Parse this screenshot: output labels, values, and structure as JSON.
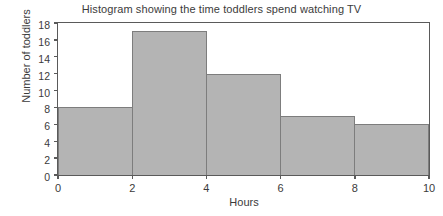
{
  "chart_data": {
    "type": "bar",
    "title": "Histogram showing the time toddlers spend watching TV",
    "xlabel": "Hours",
    "ylabel": "Number of toddlers",
    "categories": [
      "0-2",
      "2-4",
      "4-6",
      "6-8",
      "8-10"
    ],
    "bin_edges": [
      0,
      2,
      4,
      6,
      8,
      10
    ],
    "values": [
      8,
      17,
      12,
      7,
      6
    ],
    "xlim": [
      0,
      10
    ],
    "ylim": [
      0,
      18
    ],
    "x_ticks": [
      "0",
      "2",
      "4",
      "6",
      "8",
      "10"
    ],
    "y_ticks": [
      "0",
      "2",
      "4",
      "6",
      "8",
      "10",
      "12",
      "14",
      "16",
      "18"
    ],
    "grid": false,
    "legend": false,
    "bar_color": "#b4b4b4",
    "bar_border_color": "#7d7d7d",
    "axis_color": "#5a5a5a",
    "background": "#ffffff"
  }
}
